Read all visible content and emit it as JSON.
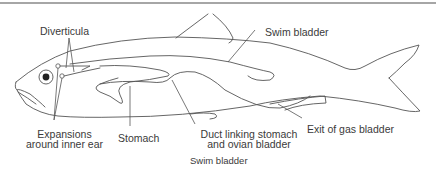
{
  "figure": {
    "title": "Swim bladder",
    "labels": {
      "diverticula": "Diverticula",
      "swim_bladder": "Swim bladder",
      "expansions_line1": "Expansions",
      "expansions_line2": "around inner ear",
      "stomach": "Stomach",
      "duct_line1": "Duct linking stomach",
      "duct_line2": "and ovian bladder",
      "exit_gas_bladder": "Exit of gas bladder"
    },
    "caption": "Swim bladder",
    "colors": {
      "stroke": "#555555",
      "text": "#3a3a3a",
      "top_rule": "#888888",
      "background": "#ffffff"
    }
  }
}
